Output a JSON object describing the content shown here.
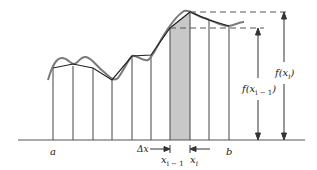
{
  "diagram": {
    "labels": {
      "a": "a",
      "b": "b",
      "delta_x": "Δx",
      "x_i_minus_1": "x",
      "x_i_minus_1_sub": "i − 1",
      "x_i": "x",
      "x_i_sub": "i",
      "f_x_i": "f(x",
      "f_x_i_sub": "i",
      "f_x_i_close": ")",
      "f_x_i_minus_1": "f(x",
      "f_x_i_minus_1_sub": "i − 1",
      "f_x_i_minus_1_close": ")"
    },
    "colors": {
      "curve": "#7a7a7a",
      "polygon": "#222222",
      "shade": "#c8c8c8",
      "axis": "#555555",
      "dashed": "#555555"
    }
  }
}
